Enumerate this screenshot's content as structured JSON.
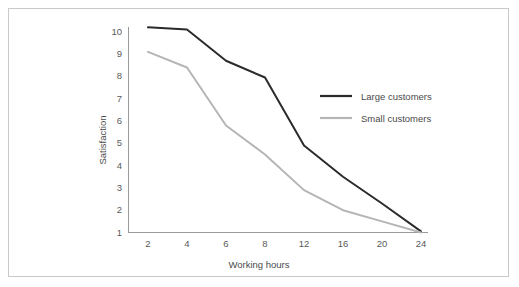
{
  "figure": {
    "background_color": "#ffffff",
    "border_color": "#c9c9c9"
  },
  "chart_data": {
    "type": "line",
    "title": "",
    "subtitle": "",
    "xlabel": "Working hours",
    "ylabel": "Satisfaction",
    "categories": [
      "2",
      "4",
      "6",
      "8",
      "12",
      "16",
      "20",
      "24"
    ],
    "x_tick_labels": [
      "2",
      "4",
      "6",
      "8",
      "12",
      "16",
      "20",
      "24"
    ],
    "y_tick_labels": [
      "1",
      "2",
      "3",
      "4",
      "5",
      "6",
      "7",
      "8",
      "9",
      "10"
    ],
    "ylim": [
      1,
      10.6
    ],
    "xlim": [
      0,
      7
    ],
    "grid": false,
    "legend_position": "center-right",
    "series": [
      {
        "name": "Large customers",
        "color": "#2b2b2b",
        "line_width": 2,
        "values": [
          10.2,
          10.1,
          8.7,
          7.95,
          4.9,
          3.5,
          2.3,
          1.05
        ]
      },
      {
        "name": "Small customers",
        "color": "#b5b5b5",
        "line_width": 2,
        "values": [
          9.1,
          8.4,
          5.8,
          4.5,
          2.9,
          2.0,
          1.5,
          1.0
        ]
      }
    ]
  },
  "legend": {
    "entries": [
      {
        "label": "Large customers",
        "color": "#2b2b2b"
      },
      {
        "label": "Small customers",
        "color": "#b5b5b5"
      }
    ]
  }
}
